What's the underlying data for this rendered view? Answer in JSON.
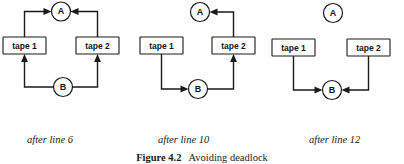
{
  "figure": {
    "label": "Figure 4.2",
    "title": "Avoiding deadlock",
    "ink_color": "#1a1a1a",
    "background_color": "#ffffff"
  },
  "nodes": {
    "process_a": "A",
    "process_b": "B",
    "tape_1": "tape 1",
    "tape_2": "tape 2"
  },
  "panels": [
    {
      "id": "panel-after-line-6",
      "caption": "after line 6",
      "nodes": [
        "A",
        "tape 1",
        "tape 2",
        "B"
      ],
      "edges": [
        {
          "from": "tape 1",
          "to": "A",
          "route": "up-then-right"
        },
        {
          "from": "tape 2",
          "to": "A",
          "route": "up-then-left"
        },
        {
          "from": "B",
          "to": "tape 1",
          "route": "left-then-up"
        },
        {
          "from": "B",
          "to": "tape 2",
          "route": "right-then-up"
        }
      ],
      "edge_count": 4
    },
    {
      "id": "panel-after-line-10",
      "caption": "after line 10",
      "nodes": [
        "A",
        "tape 1",
        "tape 2",
        "B"
      ],
      "edges": [
        {
          "from": "tape 2",
          "to": "A",
          "route": "up-then-left"
        },
        {
          "from": "tape 1",
          "to": "B",
          "route": "down-then-right"
        },
        {
          "from": "B",
          "to": "tape 2",
          "route": "right-then-up"
        }
      ],
      "edge_count": 3
    },
    {
      "id": "panel-after-line-12",
      "caption": "after line 12",
      "nodes": [
        "A",
        "tape 1",
        "tape 2",
        "B"
      ],
      "edges": [
        {
          "from": "tape 1",
          "to": "B",
          "route": "down-then-right"
        },
        {
          "from": "tape 2",
          "to": "B",
          "route": "down-then-left"
        }
      ],
      "edge_count": 2
    }
  ]
}
